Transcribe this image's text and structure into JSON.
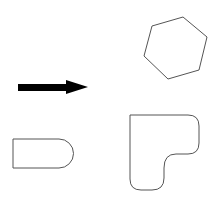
{
  "canvas": {
    "width": 216,
    "height": 199,
    "background": "#ffffff"
  },
  "shapes": [
    {
      "name": "hexagon",
      "type": "polygon",
      "stroke": "#555555",
      "fill": "none",
      "points": "152,26 183,17 207,37 199,70 168,79 144,56"
    },
    {
      "name": "arrow-right",
      "type": "arrow",
      "fill": "#000000",
      "points": "18,84 66,84 66,80 88,87 66,94 66,91 18,91"
    },
    {
      "name": "bullet-shape",
      "type": "path",
      "stroke": "#555555",
      "fill": "none",
      "d": "M13,139 L59,139 A14.5,14.5 0 0 1 59,168 L13,168 Z"
    },
    {
      "name": "l-shape",
      "type": "path",
      "stroke": "#555555",
      "fill": "none",
      "d": "M130,115 L188,115 Q199,115 199,126 L199,143 Q199,154 188,154 L176,154 Q164,154 164,168 L164,178 Q164,190 152,190 L141,190 Q130,190 130,179 Z"
    }
  ]
}
